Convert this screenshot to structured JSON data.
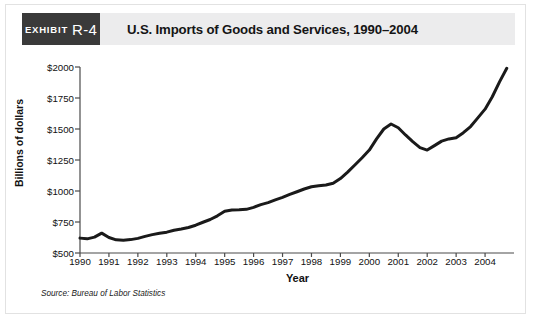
{
  "header": {
    "exhibit_word": "EXHIBIT",
    "exhibit_number": "R-4",
    "title": "U.S. Imports of Goods and Services, 1990–2004",
    "badge_color": "#3a3a3a",
    "band_color": "#ececed"
  },
  "source": "Source: Bureau of Labor Statistics",
  "chart_data": {
    "type": "line",
    "title": "U.S. Imports of Goods and Services, 1990–2004",
    "xlabel": "Year",
    "ylabel": "Billions of dollars",
    "xlim": [
      1990,
      2005
    ],
    "ylim": [
      500,
      2000
    ],
    "ytick_labels": [
      "$2000",
      "$1750",
      "$1500",
      "$1250",
      "$1000",
      "$750",
      "$500"
    ],
    "ytick_values": [
      2000,
      1750,
      1500,
      1250,
      1000,
      750,
      500
    ],
    "xtick_labels": [
      "1990",
      "1991",
      "1992",
      "1993",
      "1994",
      "1995",
      "1996",
      "1997",
      "1998",
      "1999",
      "2000",
      "2001",
      "2002",
      "2003",
      "2004"
    ],
    "xtick_values": [
      1990,
      1991,
      1992,
      1993,
      1994,
      1995,
      1996,
      1997,
      1998,
      1999,
      2000,
      2001,
      2002,
      2003,
      2004
    ],
    "grid": false,
    "legend": null,
    "line_color": "#1a1a1a",
    "line_width": 3,
    "series": [
      {
        "name": "U.S. Imports of Goods and Services",
        "units": "Billions of dollars",
        "x": [
          1990.0,
          1990.25,
          1990.5,
          1990.75,
          1991.0,
          1991.25,
          1991.5,
          1991.75,
          1992.0,
          1992.25,
          1992.5,
          1992.75,
          1993.0,
          1993.25,
          1993.5,
          1993.75,
          1994.0,
          1994.25,
          1994.5,
          1994.75,
          1995.0,
          1995.25,
          1995.5,
          1995.75,
          1996.0,
          1996.25,
          1996.5,
          1996.75,
          1997.0,
          1997.25,
          1997.5,
          1997.75,
          1998.0,
          1998.25,
          1998.5,
          1998.75,
          1999.0,
          1999.25,
          1999.5,
          1999.75,
          2000.0,
          2000.25,
          2000.5,
          2000.75,
          2001.0,
          2001.25,
          2001.5,
          2001.75,
          2002.0,
          2002.25,
          2002.5,
          2002.75,
          2003.0,
          2003.25,
          2003.5,
          2003.75,
          2004.0,
          2004.25,
          2004.5,
          2004.75
        ],
        "y": [
          620,
          614,
          628,
          660,
          625,
          606,
          602,
          608,
          618,
          634,
          648,
          660,
          668,
          684,
          694,
          706,
          724,
          748,
          770,
          800,
          836,
          846,
          848,
          852,
          868,
          890,
          906,
          928,
          948,
          972,
          994,
          1016,
          1034,
          1042,
          1048,
          1062,
          1100,
          1152,
          1210,
          1268,
          1330,
          1420,
          1500,
          1540,
          1510,
          1452,
          1398,
          1350,
          1330,
          1366,
          1402,
          1420,
          1430,
          1470,
          1520,
          1590,
          1660,
          1760,
          1880,
          1990
        ]
      }
    ]
  }
}
